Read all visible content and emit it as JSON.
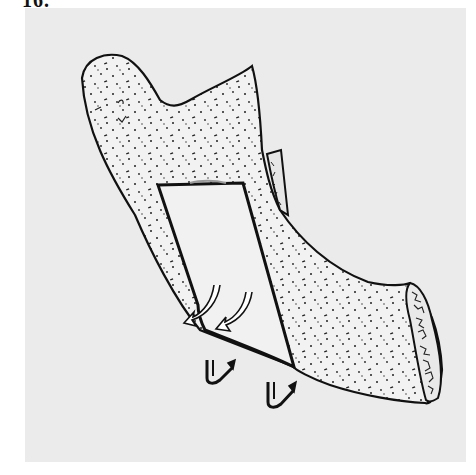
{
  "figure": {
    "label": "16.",
    "panel_color": "#ebebeb",
    "page_color": "#ffffff",
    "ink_color": "#111111"
  },
  "illustration": {
    "subject": "mandible-ramus-osteotomy",
    "parts": [
      {
        "name": "condyle",
        "description": "rounded condylar process, upper left"
      },
      {
        "name": "coronoid-process",
        "description": "pointed process, upper center"
      },
      {
        "name": "sigmoid-notch",
        "description": "curved notch between condyle and coronoid"
      },
      {
        "name": "bone-window",
        "description": "rectangular cortical window cut in ramus"
      },
      {
        "name": "medial-cortex-flap",
        "description": "thin cortical strip behind ramus edge"
      },
      {
        "name": "mandibular-body",
        "description": "body extending to lower right"
      },
      {
        "name": "cancellous-cross-section",
        "description": "cut end showing trabecular bone"
      }
    ],
    "arrows": [
      {
        "name": "curved-arrow-upper-1",
        "type": "hollow-curved"
      },
      {
        "name": "curved-arrow-upper-2",
        "type": "hollow-curved"
      },
      {
        "name": "rotation-arrow-left",
        "type": "hook-arrow"
      },
      {
        "name": "rotation-arrow-right",
        "type": "hook-arrow"
      }
    ]
  }
}
